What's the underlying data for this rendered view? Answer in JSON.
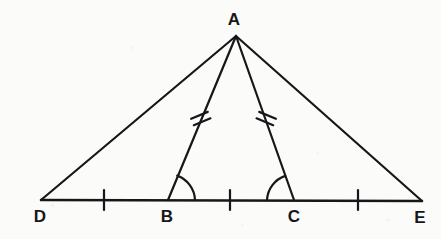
{
  "figure": {
    "type": "geometry-diagram",
    "stroke_color": "#17171a",
    "background_color": "#fbfbfa",
    "stroke_width": 2.2,
    "width": 441,
    "height": 239,
    "points": {
      "A": {
        "label": "A",
        "x": 236,
        "y": 36,
        "label_x": 234,
        "label_y": 19
      },
      "D": {
        "label": "D",
        "x": 41,
        "y": 200,
        "label_x": 40,
        "label_y": 216
      },
      "B": {
        "label": "B",
        "x": 168,
        "y": 200,
        "label_x": 167,
        "label_y": 216
      },
      "C": {
        "label": "C",
        "x": 294,
        "y": 200,
        "label_x": 294,
        "label_y": 216
      },
      "E": {
        "label": "E",
        "x": 422,
        "y": 201,
        "label_x": 420,
        "label_y": 217
      }
    },
    "segments": [
      {
        "name": "segment-DE",
        "from": "D",
        "to": "E"
      },
      {
        "name": "segment-DA",
        "from": "D",
        "to": "A"
      },
      {
        "name": "segment-AE",
        "from": "A",
        "to": "E"
      },
      {
        "name": "segment-AB",
        "from": "A",
        "to": "B"
      },
      {
        "name": "segment-AC",
        "from": "A",
        "to": "C"
      }
    ],
    "single_tick_marks": [
      {
        "name": "tick-DB",
        "on": "segment-DB",
        "x": 104,
        "y": 200
      },
      {
        "name": "tick-BC",
        "on": "segment-BC",
        "x": 230,
        "y": 200
      },
      {
        "name": "tick-CE",
        "on": "segment-CE",
        "x": 358,
        "y": 200
      }
    ],
    "double_tick_marks": [
      {
        "name": "double-tick-AB",
        "on": "segment-AB",
        "x": 200,
        "y": 119
      },
      {
        "name": "double-tick-AC",
        "on": "segment-AC",
        "x": 266,
        "y": 119
      }
    ],
    "angle_arcs": [
      {
        "name": "angle-arc-B",
        "at": "B",
        "opens": "right",
        "radius": 26
      },
      {
        "name": "angle-arc-C",
        "at": "C",
        "opens": "left",
        "radius": 26
      }
    ]
  }
}
